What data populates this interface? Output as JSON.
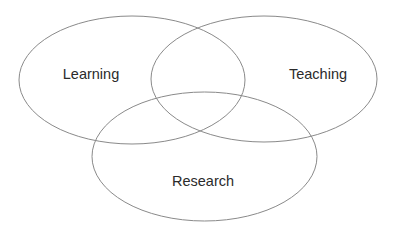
{
  "diagram": {
    "type": "venn",
    "stroke_color": "#8a8a8a",
    "text_color": "#2b2b2b",
    "sets": [
      {
        "label": "Learning",
        "cx": 132,
        "cy": 80,
        "rx": 113,
        "ry": 64,
        "label_x": 91,
        "label_y": 79
      },
      {
        "label": "Teaching",
        "cx": 264,
        "cy": 79,
        "rx": 113,
        "ry": 63,
        "label_x": 318,
        "label_y": 79
      },
      {
        "label": "Research",
        "cx": 204.5,
        "cy": 156.5,
        "rx": 112.5,
        "ry": 64.5,
        "label_x": 203,
        "label_y": 186
      }
    ]
  }
}
